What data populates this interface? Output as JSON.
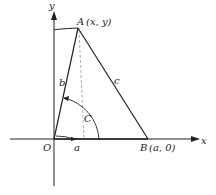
{
  "diagram": {
    "axes": {
      "x_label": "x",
      "y_label": "y"
    },
    "points": {
      "origin": "O",
      "A": "A",
      "A_coords": "(x, y)",
      "B": "B",
      "B_coords": "(a, 0)"
    },
    "sides": {
      "a": "a",
      "b": "b",
      "c": "c"
    },
    "angle": {
      "C": "C"
    },
    "colors": {
      "line": "#222222",
      "dashed": "#9a9a9a",
      "background": "#ffffff"
    }
  }
}
